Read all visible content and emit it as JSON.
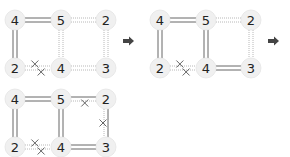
{
  "colors": {
    "node_fill": "#f0f0f0",
    "solid_line": "#666666",
    "dotted_line": "#b8b8b8",
    "cross": "#555555",
    "arrow": "#444444",
    "text": "#222222"
  },
  "arrows": [
    {
      "name": "step-arrow-1",
      "x": 129,
      "y": 41
    },
    {
      "name": "step-arrow-2",
      "x": 274,
      "y": 41
    }
  ],
  "diagrams": [
    {
      "name": "step-1",
      "offset": [
        0,
        0
      ],
      "nodes": [
        {
          "id": "a",
          "value": "4",
          "x": 15,
          "y": 20
        },
        {
          "id": "b",
          "value": "5",
          "x": 61,
          "y": 20
        },
        {
          "id": "c",
          "value": "2",
          "x": 106,
          "y": 20
        },
        {
          "id": "d",
          "value": "2",
          "x": 15,
          "y": 68
        },
        {
          "id": "e",
          "value": "4",
          "x": 61,
          "y": 68
        },
        {
          "id": "f",
          "value": "3",
          "x": 106,
          "y": 68
        }
      ],
      "edges": [
        {
          "from": "a",
          "to": "b",
          "lines": [
            "solid",
            "solid"
          ],
          "crosses": []
        },
        {
          "from": "b",
          "to": "c",
          "lines": [
            "dotted",
            "dotted"
          ],
          "crosses": []
        },
        {
          "from": "a",
          "to": "d",
          "lines": [
            "solid",
            "solid"
          ],
          "crosses": []
        },
        {
          "from": "b",
          "to": "e",
          "lines": [
            "dotted",
            "dotted"
          ],
          "crosses": []
        },
        {
          "from": "c",
          "to": "f",
          "lines": [
            "dotted",
            "dotted"
          ],
          "crosses": []
        },
        {
          "from": "d",
          "to": "e",
          "lines": [
            "dotted",
            "dotted"
          ],
          "crosses": [
            0,
            1
          ]
        },
        {
          "from": "e",
          "to": "f",
          "lines": [
            "dotted",
            "dotted"
          ],
          "crosses": []
        }
      ]
    },
    {
      "name": "step-2",
      "offset": [
        145,
        0
      ],
      "nodes": [
        {
          "id": "a",
          "value": "4",
          "x": 15,
          "y": 20
        },
        {
          "id": "b",
          "value": "5",
          "x": 61,
          "y": 20
        },
        {
          "id": "c",
          "value": "2",
          "x": 106,
          "y": 20
        },
        {
          "id": "d",
          "value": "2",
          "x": 15,
          "y": 68
        },
        {
          "id": "e",
          "value": "4",
          "x": 61,
          "y": 68
        },
        {
          "id": "f",
          "value": "3",
          "x": 106,
          "y": 68
        }
      ],
      "edges": [
        {
          "from": "a",
          "to": "b",
          "lines": [
            "solid",
            "solid"
          ],
          "crosses": []
        },
        {
          "from": "b",
          "to": "c",
          "lines": [
            "dotted",
            "dotted"
          ],
          "crosses": []
        },
        {
          "from": "a",
          "to": "d",
          "lines": [
            "solid",
            "solid"
          ],
          "crosses": []
        },
        {
          "from": "b",
          "to": "e",
          "lines": [
            "solid",
            "solid"
          ],
          "crosses": []
        },
        {
          "from": "c",
          "to": "f",
          "lines": [
            "dotted",
            "dotted"
          ],
          "crosses": []
        },
        {
          "from": "d",
          "to": "e",
          "lines": [
            "dotted",
            "dotted"
          ],
          "crosses": [
            0,
            1
          ]
        },
        {
          "from": "e",
          "to": "f",
          "lines": [
            "solid",
            "solid"
          ],
          "crosses": []
        }
      ]
    },
    {
      "name": "step-3",
      "offset": [
        0,
        79
      ],
      "nodes": [
        {
          "id": "a",
          "value": "4",
          "x": 15,
          "y": 20
        },
        {
          "id": "b",
          "value": "5",
          "x": 61,
          "y": 20
        },
        {
          "id": "c",
          "value": "2",
          "x": 106,
          "y": 20
        },
        {
          "id": "d",
          "value": "2",
          "x": 15,
          "y": 68
        },
        {
          "id": "e",
          "value": "4",
          "x": 61,
          "y": 68
        },
        {
          "id": "f",
          "value": "3",
          "x": 106,
          "y": 68
        }
      ],
      "edges": [
        {
          "from": "a",
          "to": "b",
          "lines": [
            "solid",
            "solid"
          ],
          "crosses": []
        },
        {
          "from": "b",
          "to": "c",
          "lines": [
            "solid",
            "dotted"
          ],
          "crosses": [
            1
          ]
        },
        {
          "from": "a",
          "to": "d",
          "lines": [
            "solid",
            "solid"
          ],
          "crosses": []
        },
        {
          "from": "b",
          "to": "e",
          "lines": [
            "solid",
            "solid"
          ],
          "crosses": []
        },
        {
          "from": "c",
          "to": "f",
          "lines": [
            "dotted",
            "solid"
          ],
          "crosses": [
            0
          ]
        },
        {
          "from": "d",
          "to": "e",
          "lines": [
            "dotted",
            "dotted"
          ],
          "crosses": [
            0,
            1
          ]
        },
        {
          "from": "e",
          "to": "f",
          "lines": [
            "solid",
            "solid"
          ],
          "crosses": []
        }
      ]
    }
  ]
}
